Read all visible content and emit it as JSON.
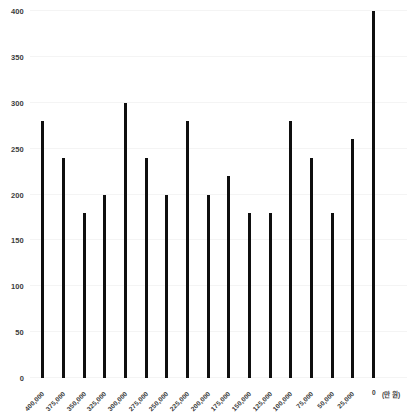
{
  "chart_data": {
    "type": "bar",
    "title": "",
    "subtitle": "",
    "xlabel": "",
    "ylabel": "",
    "unit_label": "(만 원)",
    "zero_label": "0",
    "grid": true,
    "legend": "none",
    "ylim": [
      0,
      400
    ],
    "ytick_step": 50,
    "yticks": [
      0,
      50,
      100,
      150,
      200,
      250,
      300,
      350,
      400
    ],
    "ytick_labels": [
      "0",
      "50",
      "100",
      "150",
      "200",
      "250",
      "300",
      "350",
      "400"
    ],
    "categories": [
      "400,000",
      "375,000",
      "350,000",
      "325,000",
      "300,000",
      "275,000",
      "250,000",
      "225,000",
      "200,000",
      "175,000",
      "150,000",
      "125,000",
      "100,000",
      "75,000",
      "50,000",
      "25,000",
      "0"
    ],
    "values": [
      280,
      240,
      180,
      200,
      300,
      240,
      200,
      280,
      200,
      220,
      180,
      180,
      280,
      240,
      180,
      260,
      400
    ],
    "series": [
      {
        "name": "series-1",
        "values": [
          280,
          240,
          180,
          200,
          300,
          240,
          200,
          280,
          200,
          220,
          180,
          180,
          280,
          240,
          180,
          260,
          400
        ]
      }
    ],
    "colors": {
      "bar": "#0f0f0f",
      "background": "#ffffff",
      "gridline": "#f4f4f4",
      "tick_text": "#3c3c3c"
    }
  }
}
